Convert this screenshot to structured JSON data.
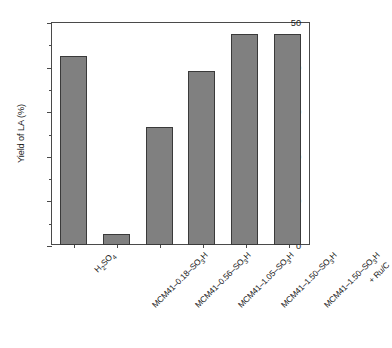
{
  "chart_data": {
    "type": "bar",
    "title": "",
    "xlabel": "",
    "ylabel": "Yield of LA (%)",
    "ylim": [
      0,
      50
    ],
    "ytick_values": [
      0,
      10,
      20,
      30,
      40,
      50
    ],
    "ytick_labels": [
      "0",
      "10",
      "20",
      "30",
      "40",
      "50"
    ],
    "yminor_values": [
      5,
      15,
      25,
      35,
      45
    ],
    "grid": false,
    "legend": null,
    "bar_color": "#808080",
    "bar_edge_color": "#3a3a3a",
    "axis_color": "#4a4a4a",
    "categories": [
      "H2SO4",
      "MCM41-0.18-SO3H",
      "MCM41-0.56-SO3H",
      "MCM41-1.05-SO3H",
      "MCM41-1.50-SO3H",
      "MCM41-1.50-SO3H + Ru/C"
    ],
    "values": [
      42.4,
      2.4,
      26.5,
      39.0,
      47.3,
      47.3
    ],
    "category_labels_rich": [
      {
        "line1_pre": "H",
        "line1_sub": "2",
        "line1_mid": "SO",
        "line1_sub2": "4",
        "line1_post": "",
        "line2": ""
      },
      {
        "line1_pre": "MCM41–0.18–SO",
        "line1_sub": "3",
        "line1_mid": "H",
        "line1_sub2": "",
        "line1_post": "",
        "line2": ""
      },
      {
        "line1_pre": "MCM41–0.56–SO",
        "line1_sub": "3",
        "line1_mid": "H",
        "line1_sub2": "",
        "line1_post": "",
        "line2": ""
      },
      {
        "line1_pre": "MCM41–1.05–SO",
        "line1_sub": "3",
        "line1_mid": "H",
        "line1_sub2": "",
        "line1_post": "",
        "line2": ""
      },
      {
        "line1_pre": "MCM41–1.50–SO",
        "line1_sub": "3",
        "line1_mid": "H",
        "line1_sub2": "",
        "line1_post": "",
        "line2": ""
      },
      {
        "line1_pre": "MCM41–1.50–SO",
        "line1_sub": "3",
        "line1_mid": "H",
        "line1_sub2": "",
        "line1_post": "",
        "line2": "+ Ru/C"
      }
    ],
    "ylabel_rich": {
      "pre": "Yield of LA (%)"
    }
  }
}
